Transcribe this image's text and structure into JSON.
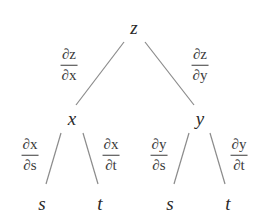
{
  "diagram": {
    "type": "tree",
    "nodes": {
      "root": {
        "label": "z"
      },
      "mid_left": {
        "label": "x"
      },
      "mid_right": {
        "label": "y"
      },
      "leaf_1": {
        "label": "s"
      },
      "leaf_2": {
        "label": "t"
      },
      "leaf_3": {
        "label": "s"
      },
      "leaf_4": {
        "label": "t"
      }
    },
    "edges": [
      {
        "from": "z",
        "to": "x",
        "label_num": "∂z",
        "label_den": "∂x"
      },
      {
        "from": "z",
        "to": "y",
        "label_num": "∂z",
        "label_den": "∂y"
      },
      {
        "from": "x",
        "to": "s",
        "label_num": "∂x",
        "label_den": "∂s"
      },
      {
        "from": "x",
        "to": "t",
        "label_num": "∂x",
        "label_den": "∂t"
      },
      {
        "from": "y",
        "to": "s",
        "label_num": "∂y",
        "label_den": "∂s"
      },
      {
        "from": "y",
        "to": "t",
        "label_num": "∂y",
        "label_den": "∂t"
      }
    ],
    "line_color": "#8a8a8a",
    "text_color": "#2a2a2a"
  }
}
